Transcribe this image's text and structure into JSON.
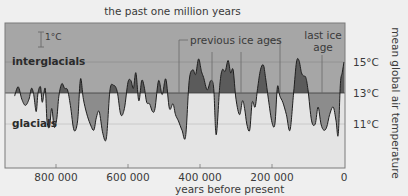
{
  "chart_data": {
    "type": "area",
    "title": "the past one million years",
    "xlabel": "years before present",
    "ylabel": "mean global air temperature",
    "x_ticks": [
      "800 000",
      "600 000",
      "400 000",
      "200 000",
      "0"
    ],
    "y_ticks": [
      "15°C",
      "13°C",
      "11°C"
    ],
    "xlim": [
      940000,
      0
    ],
    "ylim": [
      8.5,
      17.5
    ],
    "baseline": 13,
    "grid": {
      "horizontal_at": [
        15,
        13,
        11
      ]
    },
    "region_labels": {
      "above": "interglacials",
      "below": "glacials"
    },
    "scale_bar": "1°C",
    "annotations": [
      {
        "text": "previous ice ages",
        "x": [
          430000,
          340000,
          260000,
          180000
        ]
      },
      {
        "text": "last ice\nage",
        "x": [
          60000
        ]
      }
    ],
    "series": [
      {
        "name": "mean global air temperature",
        "x_years": [
          915000,
          905000,
          895000,
          885000,
          875000,
          868000,
          862000,
          855000,
          850000,
          843000,
          838000,
          830000,
          825000,
          818000,
          812000,
          805000,
          798000,
          792000,
          784000,
          776000,
          768000,
          760000,
          750000,
          740000,
          732000,
          724000,
          715000,
          705000,
          695000,
          688000,
          680000,
          670000,
          660000,
          650000,
          640000,
          630000,
          620000,
          610000,
          600000,
          592000,
          585000,
          578000,
          570000,
          562000,
          555000,
          548000,
          540000,
          532000,
          525000,
          515000,
          505000,
          495000,
          485000,
          475000,
          468000,
          460000,
          450000,
          440000,
          430000,
          420000,
          412000,
          404000,
          396000,
          390000,
          380000,
          370000,
          362000,
          355000,
          345000,
          338000,
          330000,
          322000,
          315000,
          308000,
          300000,
          290000,
          282000,
          276000,
          270000,
          262000,
          255000,
          247000,
          240000,
          232000,
          224000,
          218000,
          210000,
          200000,
          192000,
          185000,
          178000,
          170000,
          160000,
          150000,
          140000,
          132000,
          125000,
          118000,
          112000,
          106000,
          100000,
          90000,
          80000,
          72000,
          64000,
          56000,
          48000,
          40000,
          30000,
          22000,
          16000,
          10000,
          5000,
          0
        ],
        "temp_c": [
          12.8,
          13.4,
          12.6,
          12.2,
          12.6,
          13.3,
          12.9,
          11.8,
          13.0,
          13.4,
          12.4,
          13.3,
          11.2,
          10.8,
          12.0,
          10.8,
          11.3,
          12.8,
          13.6,
          13.3,
          13.2,
          12.2,
          10.6,
          11.2,
          13.9,
          12.6,
          11.7,
          11.0,
          10.6,
          11.4,
          11.8,
          10.4,
          10.1,
          13.2,
          13.5,
          13.1,
          11.6,
          12.0,
          13.7,
          13.8,
          13.3,
          14.3,
          12.5,
          13.8,
          13.4,
          12.4,
          12.3,
          11.8,
          12.0,
          13.8,
          12.9,
          13.9,
          12.0,
          12.3,
          11.6,
          11.2,
          10.6,
          10.2,
          13.8,
          14.5,
          14.2,
          15.2,
          14.4,
          14.0,
          13.2,
          13.8,
          13.3,
          10.3,
          13.5,
          14.5,
          14.4,
          15.1,
          14.3,
          14.5,
          12.6,
          11.6,
          12.5,
          12.0,
          11.0,
          10.6,
          12.4,
          12.1,
          13.3,
          14.5,
          14.8,
          14.0,
          12.6,
          11.1,
          11.0,
          13.4,
          12.8,
          12.4,
          11.6,
          10.6,
          13.0,
          15.0,
          15.1,
          14.3,
          14.1,
          14.0,
          13.2,
          11.2,
          11.0,
          12.1,
          11.0,
          10.6,
          10.8,
          11.6,
          12.1,
          11.2,
          10.3,
          13.6,
          14.3,
          15.0
        ]
      }
    ]
  },
  "labels": {
    "title": "the past one million years",
    "xlabel": "years before present",
    "ylabel": "mean global air temperature",
    "xticks": [
      "800 000",
      "600 000",
      "400 000",
      "200 000",
      "0"
    ],
    "yticks": [
      "15°C",
      "13°C",
      "11°C"
    ],
    "interglacials": "interglacials",
    "glacials": "glacials",
    "scale": "1°C",
    "previous_ice_ages": "previous ice ages",
    "last_ice_age_line1": "last ice",
    "last_ice_age_line2": "age"
  },
  "colors": {
    "panel_warm": "#a6a6a6",
    "panel_cold": "#e4e4e4",
    "fill_warm": "#5b5b5b",
    "fill_cold": "#8c8c8c",
    "line": "#1e1e1e"
  }
}
